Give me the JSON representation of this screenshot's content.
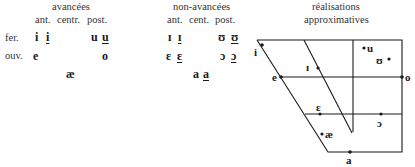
{
  "panels": {
    "advanced": {
      "title": "avancées",
      "columns": [
        "ant.",
        "centr.",
        "post."
      ]
    },
    "non_advanced": {
      "title": "non-avancées",
      "columns": [
        "ant.",
        "cent.",
        "post."
      ]
    },
    "realizations": {
      "title_line1": "réalisations",
      "title_line2": "approximatives"
    }
  },
  "rows": {
    "closed": "fer.",
    "open": "ouv."
  },
  "advanced_vowels": {
    "closed_front": "i",
    "closed_front_tense": "i",
    "closed_back": "u",
    "closed_back_tense": "u",
    "open_front": "e",
    "open_back": "o",
    "low": "æ"
  },
  "non_advanced_vowels": {
    "closed_front": "ɪ",
    "closed_front_tense": "ɪ",
    "closed_back": "ʊ",
    "closed_back_tense": "ʊ",
    "open_front": "ɛ",
    "open_front_tense": "ɛ",
    "open_back": "ɔ",
    "open_back_tense": "ɔ",
    "low": "a",
    "low_tense": "a"
  },
  "diagram_points": [
    {
      "label": "i",
      "x": 262,
      "y": 45
    },
    {
      "label": "e",
      "x": 281,
      "y": 77
    },
    {
      "label": "ɪ",
      "x": 310,
      "y": 68
    },
    {
      "label": "u",
      "x": 364,
      "y": 48
    },
    {
      "label": "ʊ",
      "x": 387,
      "y": 59
    },
    {
      "label": "o",
      "x": 402,
      "y": 77
    },
    {
      "label": "ɛ",
      "x": 320,
      "y": 114
    },
    {
      "label": "ɔ",
      "x": 381,
      "y": 114
    },
    {
      "label": "æ",
      "x": 322,
      "y": 134
    },
    {
      "label": "a",
      "x": 350,
      "y": 152
    }
  ],
  "colors": {
    "ink": "#1a1a1a",
    "background": "#ffffff"
  }
}
